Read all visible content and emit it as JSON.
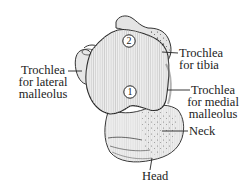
{
  "figure": {
    "markers": [
      {
        "id": "marker-2",
        "text": "2"
      },
      {
        "id": "marker-1",
        "text": "1"
      }
    ],
    "labels": {
      "lateral_malleolus": {
        "lines": [
          "Trochlea",
          "for lateral",
          "malleolus"
        ]
      },
      "tibia": {
        "lines": [
          "Trochlea",
          "for tibia"
        ]
      },
      "medial_malleolus": {
        "lines": [
          "Trochlea",
          "for medial",
          "malleolus"
        ]
      },
      "neck": {
        "lines": [
          "Neck"
        ]
      },
      "head": {
        "lines": [
          "Head"
        ]
      }
    },
    "colors": {
      "ink": "#222222",
      "bone_fill": "#ececec",
      "bone_shade": "#d8d8d8",
      "background": "#ffffff"
    }
  }
}
